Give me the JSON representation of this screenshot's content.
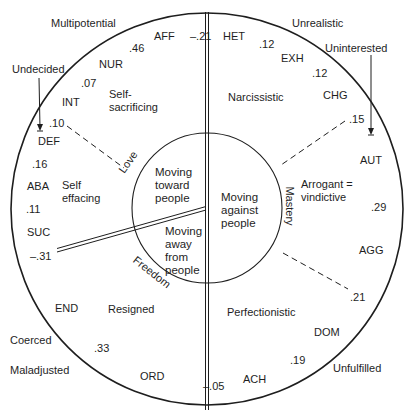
{
  "diagram": {
    "inner_circle": {
      "toward": "Moving\ntoward\npeople",
      "away": "Moving\naway\nfrom\npeople",
      "against": "Moving\nagainst\npeople"
    },
    "axis_labels": {
      "love": "Love",
      "freedom": "Freedom",
      "mastery": "Mastery"
    },
    "styles": {
      "self_sacrificing": "Self-\nsacrificing",
      "self_effacing": "Self\neffacing",
      "resigned": "Resigned",
      "narcissistic": "Narcissistic",
      "arrogant_vindictive": "Arrogant =\nvindictive",
      "perfectionistic": "Perfectionistic"
    },
    "outer_labels": {
      "multipotential": "Multipotential",
      "undecided": "Undecided",
      "unrealistic": "Unrealistic",
      "uninterested": "Uninterested",
      "coerced": "Coerced",
      "maladjusted": "Maladjusted",
      "unfulfilled": "Unfulfilled"
    },
    "needs": {
      "aff": "AFF",
      "nur": "NUR",
      "int": "INT",
      "def": "DEF",
      "aba": "ABA",
      "suc": "SUC",
      "end": "END",
      "ord": "ORD",
      "ach": "ACH",
      "dom": "DOM",
      "agg": "AGG",
      "aut": "AUT",
      "chg": "CHG",
      "exh": "EXH",
      "het": "HET"
    },
    "correlations": {
      "aff_nur": ".46",
      "nur_int": ".07",
      "int_def": ".10",
      "def_aba": ".16",
      "aba_suc": ".11",
      "suc_end": "–.31",
      "end_ord": ".33",
      "ord_ach": "–.05",
      "ach_dom": ".19",
      "dom_agg": ".21",
      "agg_aut": ".29",
      "aut_chg": ".15",
      "chg_exh": ".12",
      "exh_het": ".12",
      "het_aff": "–.21"
    }
  }
}
